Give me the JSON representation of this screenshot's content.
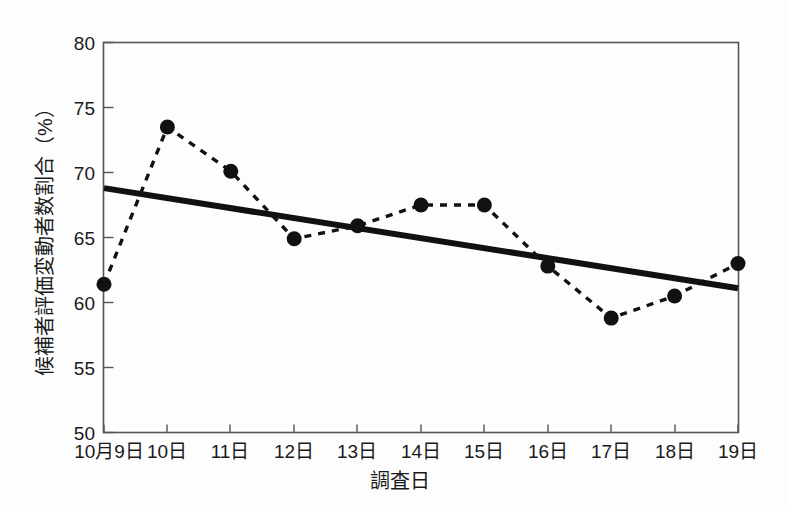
{
  "chart_data": {
    "type": "line",
    "title": "",
    "xlabel": "調査日",
    "ylabel": "候補者評価変動者数割合（%）",
    "categories": [
      "10月9日",
      "10日",
      "11日",
      "12日",
      "13日",
      "14日",
      "15日",
      "16日",
      "17日",
      "18日",
      "19日"
    ],
    "values": [
      61.4,
      73.5,
      70.1,
      64.9,
      65.9,
      67.5,
      67.5,
      62.8,
      58.8,
      60.5,
      63.0
    ],
    "series": [
      {
        "name": "候補者評価変動者数割合",
        "style": "dashed-with-markers",
        "marker": "filled-circle",
        "color": "#111111",
        "values": [
          61.4,
          73.5,
          70.1,
          64.9,
          65.9,
          67.5,
          67.5,
          62.8,
          58.8,
          60.5,
          63.0
        ]
      },
      {
        "name": "近似直線（トレンド）",
        "style": "solid-thick",
        "color": "#111111",
        "endpoints": [
          68.8,
          61.1
        ],
        "values": [
          68.8,
          68.03,
          67.26,
          66.49,
          65.72,
          64.95,
          64.18,
          63.41,
          62.64,
          61.87,
          61.1
        ]
      }
    ],
    "ylim": [
      50,
      80
    ],
    "yticks": [
      50,
      55,
      60,
      65,
      70,
      75,
      80
    ],
    "ytick_labels": [
      "50",
      "55",
      "60",
      "65",
      "70",
      "75",
      "80"
    ],
    "xtick_labels": [
      "10月9日",
      "10日",
      "11日",
      "12日",
      "13日",
      "14日",
      "15日",
      "16日",
      "17日",
      "18日",
      "19日"
    ],
    "grid": false,
    "legend": "none",
    "annotations": []
  },
  "axes": {
    "y_title": "候補者評価変動者数割合（%）",
    "x_title": "調査日",
    "y_labels": [
      "80",
      "75",
      "70",
      "65",
      "60",
      "55",
      "50"
    ],
    "x_labels": [
      "10月9日",
      "10日",
      "11日",
      "12日",
      "13日",
      "14日",
      "15日",
      "16日",
      "17日",
      "18日",
      "19日"
    ]
  },
  "colors": {
    "background": "#fdfdfd",
    "frame": "#555555",
    "ink": "#111111",
    "text": "#1a1a1a"
  }
}
